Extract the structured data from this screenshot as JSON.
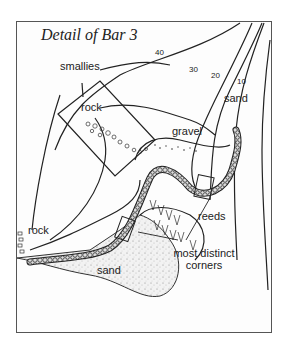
{
  "figure": {
    "title": "Detail of Bar 3",
    "labels": {
      "smallies": "smallies",
      "rock_top": "rock",
      "gravel": "gravel",
      "sand_top": "sand",
      "reeds": "reeds",
      "rock_left": "rock",
      "sand_bottom": "sand",
      "corners_line1": "most distinct",
      "corners_line2": "corners"
    },
    "depth_contours": [
      "40",
      "30",
      "20",
      "10"
    ]
  }
}
